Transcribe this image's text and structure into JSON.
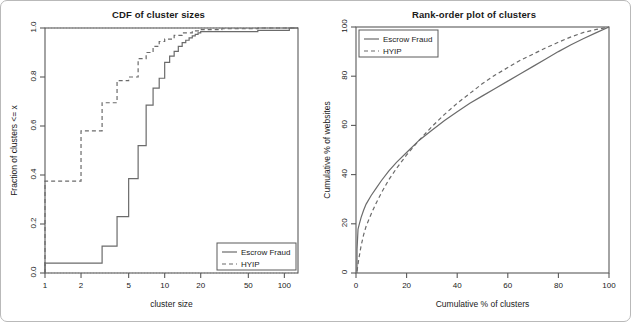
{
  "figure": {
    "panels": [
      "cdf",
      "rank-order"
    ]
  },
  "chart_data": [
    {
      "type": "line",
      "id": "cdf",
      "title": "CDF of cluster sizes",
      "xlabel": "cluster size",
      "ylabel": "Fraction of clusters <= x",
      "xscale": "log",
      "xlim": [
        1,
        130
      ],
      "ylim": [
        0.0,
        1.0
      ],
      "xticks": [
        1,
        2,
        5,
        10,
        20,
        50,
        100
      ],
      "xticklabels": [
        "1",
        "2",
        "5",
        "10",
        "20",
        "50",
        "100"
      ],
      "yticks": [
        0.0,
        0.2,
        0.4,
        0.6,
        0.8,
        1.0
      ],
      "yticklabels": [
        "0.0",
        "0.2",
        "0.4",
        "0.6",
        "0.8",
        "1.0"
      ],
      "grid": "dotted reference lines at y=0.0 and y=1.0",
      "legend": {
        "position": "bottom-right",
        "entries": [
          {
            "name": "Escrow Fraud",
            "style": "solid"
          },
          {
            "name": "HYIP",
            "style": "dashed"
          }
        ]
      },
      "series": [
        {
          "name": "Escrow Fraud",
          "style": "solid",
          "step": true,
          "x": [
            1,
            2,
            3,
            4,
            5,
            6,
            7,
            8,
            9,
            10,
            11,
            12,
            13,
            14,
            15,
            16,
            17,
            18,
            19,
            20,
            60,
            110,
            130
          ],
          "y": [
            0.04,
            0.04,
            0.11,
            0.23,
            0.385,
            0.52,
            0.685,
            0.755,
            0.795,
            0.86,
            0.885,
            0.905,
            0.925,
            0.94,
            0.95,
            0.96,
            0.968,
            0.974,
            0.98,
            0.985,
            0.99,
            1.0,
            1.0
          ]
        },
        {
          "name": "HYIP",
          "style": "dashed",
          "step": true,
          "x": [
            1,
            2,
            3,
            4,
            5,
            6,
            7,
            8,
            9,
            10,
            12,
            14,
            17,
            20,
            30,
            60,
            130
          ],
          "y": [
            0.375,
            0.58,
            0.695,
            0.785,
            0.8,
            0.875,
            0.9,
            0.925,
            0.945,
            0.955,
            0.97,
            0.98,
            0.988,
            0.993,
            0.997,
            1.0,
            1.0
          ]
        }
      ]
    },
    {
      "type": "line",
      "id": "rank-order",
      "title": "Rank-order plot of clusters",
      "xlabel": "Cumulative % of clusters",
      "ylabel": "Cumulative % of websites",
      "xscale": "linear",
      "xlim": [
        0,
        100
      ],
      "ylim": [
        0,
        100
      ],
      "xticks": [
        0,
        20,
        40,
        60,
        80,
        100
      ],
      "xticklabels": [
        "0",
        "20",
        "40",
        "60",
        "80",
        "100"
      ],
      "yticks": [
        0,
        20,
        40,
        60,
        80,
        100
      ],
      "yticklabels": [
        "0",
        "20",
        "40",
        "60",
        "80",
        "100"
      ],
      "grid": "none",
      "legend": {
        "position": "top-left",
        "entries": [
          {
            "name": "Escrow Fraud",
            "style": "solid"
          },
          {
            "name": "HYIP",
            "style": "dashed"
          }
        ]
      },
      "series": [
        {
          "name": "Escrow Fraud",
          "style": "solid",
          "x": [
            0.4,
            0.8,
            1.2,
            2,
            3,
            4,
            6,
            8,
            10,
            13,
            16,
            20,
            25,
            30,
            35,
            40,
            45,
            50,
            55,
            60,
            65,
            70,
            75,
            80,
            85,
            90,
            95,
            100
          ],
          "y": [
            9.5,
            17.8,
            19.5,
            22.5,
            25.5,
            28,
            31.5,
            34.5,
            37.5,
            41.5,
            45,
            49,
            54,
            58,
            62,
            65.5,
            69,
            72,
            75,
            78,
            81,
            84,
            87,
            90,
            92.8,
            95.3,
            97.7,
            100
          ]
        },
        {
          "name": "HYIP",
          "style": "dashed",
          "x": [
            0.4,
            1,
            2,
            3,
            4,
            6,
            8,
            10,
            13,
            16,
            20,
            25,
            30,
            35,
            40,
            45,
            50,
            55,
            60,
            65,
            70,
            75,
            80,
            85,
            90,
            95,
            100
          ],
          "y": [
            0.8,
            5,
            11,
            15.5,
            19,
            24,
            28.5,
            32.5,
            38,
            42.5,
            48,
            54,
            59.5,
            64.5,
            69,
            73,
            77,
            80.5,
            83.5,
            86.5,
            89,
            91.5,
            93.8,
            96,
            97.8,
            99,
            100
          ]
        }
      ]
    }
  ]
}
